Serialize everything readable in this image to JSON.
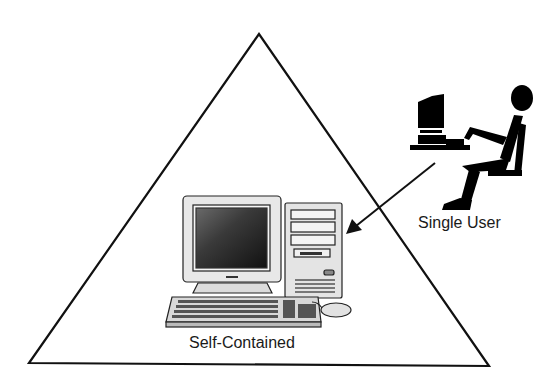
{
  "diagram": {
    "type": "triangle-concept",
    "labels": {
      "single_user": "Single User",
      "self_contained": "Self-Contained"
    },
    "shapes": {
      "triangle": {
        "apex": [
          259,
          34
        ],
        "bottom_left": [
          29,
          363
        ],
        "bottom_right": [
          489,
          366
        ]
      },
      "arrow": {
        "from": [
          435,
          163
        ],
        "to": [
          348,
          233
        ],
        "meaning": "single user points to self-contained computer"
      }
    },
    "icons": [
      "desktop-computer-icon",
      "seated-user-at-computer-icon"
    ],
    "colors": {
      "line": "#111111",
      "background": "#ffffff",
      "device_fill": "#e6e6e6",
      "screen_dark": "#2a2a2a",
      "silhouette": "#000000"
    }
  }
}
